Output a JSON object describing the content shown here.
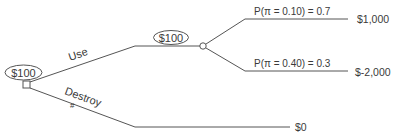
{
  "diagram": {
    "type": "decision-tree",
    "root": {
      "value_label": "$100",
      "node_type": "decision"
    },
    "branches": {
      "use": {
        "label": "Use",
        "chance_node": {
          "value_label": "$100"
        },
        "outcomes": [
          {
            "probability_label": "P(π = 0.10) = 0.7",
            "payoff": "$1,000"
          },
          {
            "probability_label": "P(π = 0.40) = 0.3",
            "payoff": "$-2,000"
          }
        ]
      },
      "destroy": {
        "label": "Destroy",
        "prune_mark": "#",
        "payoff": "$0"
      }
    },
    "colors": {
      "line": "#555555",
      "text": "#3a3a3a",
      "background": "#ffffff"
    }
  }
}
